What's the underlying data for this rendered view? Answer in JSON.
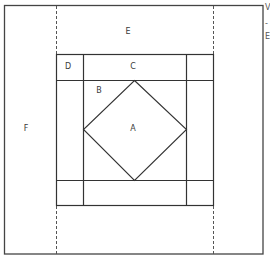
{
  "diagram": {
    "type": "quilt-block-layout",
    "stroke_color": "#3a3a3a",
    "dashed_color": "#555555",
    "outer_frame": {
      "x": 4,
      "y": 5,
      "w": 259,
      "h": 249
    },
    "dashed_lines": [
      {
        "name": "dashed-line-left",
        "x": 56,
        "y1": 5,
        "y2": 254
      },
      {
        "name": "dashed-line-right",
        "x": 213,
        "y1": 5,
        "y2": 254
      }
    ],
    "block": {
      "x": 56,
      "y": 54,
      "w": 157,
      "h": 151
    },
    "border_strip": {
      "inner_left": 83,
      "inner_right": 186,
      "inner_top": 80,
      "inner_bottom": 180
    },
    "diamond": {
      "top": [
        134,
        80
      ],
      "right": [
        186,
        129
      ],
      "bottom": [
        134,
        180
      ],
      "left": [
        83,
        129
      ]
    },
    "labels": [
      {
        "id": "A",
        "text": "A",
        "x": 133,
        "y": 129
      },
      {
        "id": "B",
        "text": "B",
        "x": 99,
        "y": 91
      },
      {
        "id": "C",
        "text": "C",
        "x": 133,
        "y": 67
      },
      {
        "id": "D",
        "text": "D",
        "x": 68,
        "y": 67
      },
      {
        "id": "E",
        "text": "E",
        "x": 128,
        "y": 32
      },
      {
        "id": "F",
        "text": "F",
        "x": 26,
        "y": 129
      }
    ],
    "cropped_edge_fragments": [
      {
        "text": "V",
        "x": 265,
        "y": 5
      },
      {
        "text": "-",
        "x": 265,
        "y": 22
      },
      {
        "text": "E",
        "x": 265,
        "y": 35
      }
    ]
  }
}
